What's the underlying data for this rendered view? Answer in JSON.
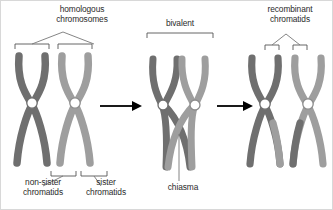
{
  "diagram": {
    "type": "biology-diagram",
    "background_color": "#ffffff",
    "border_color": "#d8d8d8",
    "text_color": "#2b2b2b"
  },
  "labels": {
    "homologous_line1": "homologous",
    "homologous_line2": "chromosomes",
    "bivalent": "bivalent",
    "recombinant_line1": "recombinant",
    "recombinant_line2": "chromatids",
    "non_sister_line1": "non-sister",
    "non_sister_line2": "chromatids",
    "sister_line1": "sister",
    "sister_line2": "chromatids",
    "chiasma": "chiasma"
  },
  "colors": {
    "chromosome_dark": "#6f6f6f",
    "chromosome_light": "#9e9e9e",
    "chromosome_dark_edge": "#5e5e5e",
    "chromosome_light_edge": "#8d8d8d",
    "centromere_fill": "#ffffff",
    "centromere_stroke": "#6f6f6f",
    "arrow": "#000000",
    "bracket": "#555555",
    "leader": "#777777"
  },
  "panels": [
    {
      "name": "stage-1-homologous-chromosomes",
      "label": "homologous chromosomes",
      "chromosomes": [
        {
          "name": "maternal-chromosome",
          "shade": "dark",
          "chromatids": 2
        },
        {
          "name": "paternal-chromosome",
          "shade": "light",
          "chromatids": 2
        }
      ],
      "sublabels": [
        "non-sister chromatids",
        "sister chromatids"
      ]
    },
    {
      "name": "stage-2-bivalent",
      "label": "bivalent",
      "chromosomes": [
        {
          "name": "maternal-chromosome",
          "shade": "dark",
          "chromatids": 2
        },
        {
          "name": "paternal-chromosome",
          "shade": "light",
          "chromatids": 2
        }
      ],
      "sublabels": [
        "chiasma"
      ],
      "crossover": true
    },
    {
      "name": "stage-3-recombinant",
      "label": "recombinant chromatids",
      "chromosomes": [
        {
          "name": "maternal-chromosome",
          "shade": "dark",
          "chromatids": 2,
          "recombinant": true
        },
        {
          "name": "paternal-chromosome",
          "shade": "light",
          "chromatids": 2,
          "recombinant": true
        }
      ]
    }
  ],
  "arrows": [
    {
      "name": "arrow-stage1-to-stage2",
      "from": "stage-1-homologous-chromosomes",
      "to": "stage-2-bivalent"
    },
    {
      "name": "arrow-stage2-to-stage3",
      "from": "stage-2-bivalent",
      "to": "stage-3-recombinant"
    }
  ]
}
